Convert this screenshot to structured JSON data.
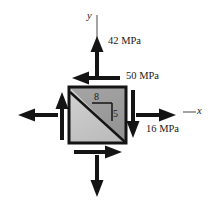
{
  "figure": {
    "type": "engineering-stress-element-diagram",
    "background_color": "#ffffff",
    "line_color": "#1a1a1a"
  },
  "axes": {
    "y_label": "y",
    "x_label": "x",
    "y_axis_name": "vertical-reference-axis",
    "x_axis_name": "horizontal-reference-axis"
  },
  "element": {
    "name": "stress-element-square",
    "fill_upper": "#9b9b9b",
    "fill_lower": "#c9c9c9",
    "border_color": "#1a1a1a",
    "diagonal_name": "plane-of-interest-diagonal"
  },
  "slope_triangle": {
    "horizontal_leg_label": "8",
    "vertical_leg_label": "5",
    "description": "slope ratio of inclined plane"
  },
  "stresses": [
    {
      "name": "normal-stress-vertical",
      "label": "42 MPa",
      "direction": "up",
      "position": "top",
      "arrow_style": "double-headed-normal"
    },
    {
      "name": "shear-stress",
      "label": "50 MPa",
      "direction": "left",
      "position": "top-edge",
      "arrow_style": "shear"
    },
    {
      "name": "normal-stress-horizontal",
      "label": "16 MPa",
      "direction": "right",
      "position": "right",
      "arrow_style": "double-headed-normal"
    }
  ],
  "arrows": {
    "normal_up": "normal-stress-arrow-up",
    "normal_down": "normal-stress-arrow-down",
    "normal_left": "normal-stress-arrow-left",
    "normal_right": "normal-stress-arrow-right",
    "shear_top": "shear-arrow-top-left",
    "shear_bottom": "shear-arrow-bottom-right",
    "shear_left": "shear-arrow-left-up",
    "shear_right": "shear-arrow-right-down"
  }
}
